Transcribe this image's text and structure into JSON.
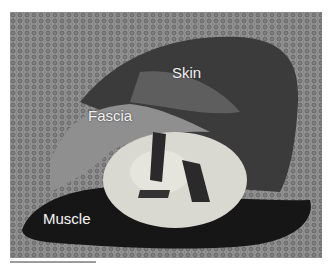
{
  "figure": {
    "labels": {
      "skin": "Skin",
      "fascia": "Fascia",
      "muscle": "Muscle"
    },
    "colors": {
      "background": "#7d7d7d",
      "skin": "#3a3a3a",
      "fascia": "#8c8c8c",
      "lesion": "#d8d8d0",
      "muscle": "#1a1a1a"
    }
  }
}
